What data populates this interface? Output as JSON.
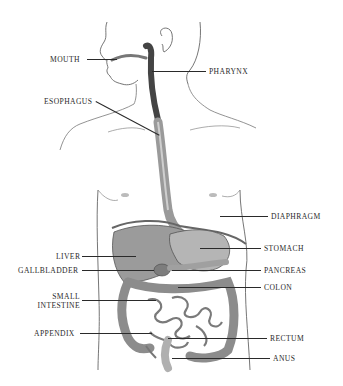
{
  "diagram": {
    "colors": {
      "background": "#ffffff",
      "outline": "#555555",
      "organ_fill": "#a9a9a9",
      "organ_dark": "#6f6f6f",
      "tract_dark": "#3a3a3a",
      "label_text": "#2a2a2a"
    },
    "labels": {
      "mouth": "MOUTH",
      "pharynx": "PHARYNX",
      "esophagus": "ESOPHAGUS",
      "diaphragm": "DIAPHRAGM",
      "stomach": "STOMACH",
      "liver": "LIVER",
      "gallbladder": "GALLBLADDER",
      "pancreas": "PANCREAS",
      "colon": "COLON",
      "small_intestine_1": "SMALL",
      "small_intestine_2": "INTESTINE",
      "appendix": "APPENDIX",
      "rectum": "RECTUM",
      "anus": "ANUS"
    }
  }
}
